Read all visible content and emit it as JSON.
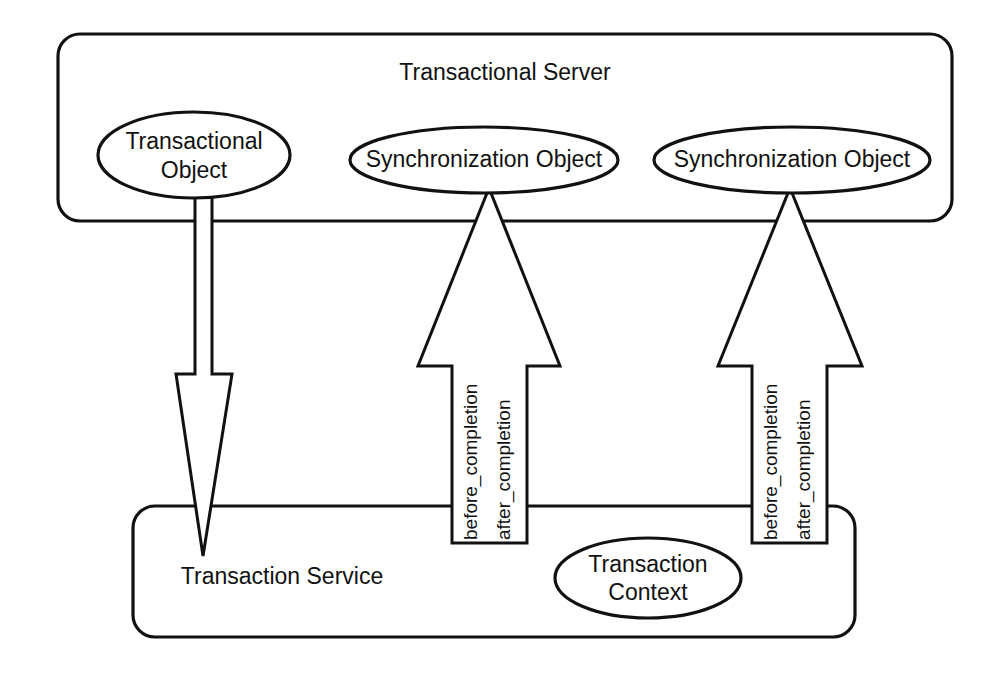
{
  "diagram": {
    "containers": [
      {
        "id": "transactional-server",
        "label": "Transactional Server",
        "label_x": 505,
        "label_y": 74,
        "x": 58,
        "y": 34,
        "width": 894,
        "height": 187,
        "corner_radius": 22
      },
      {
        "id": "transaction-service",
        "label": "Transaction Service",
        "label_x": 282,
        "label_y": 578,
        "x": 133,
        "y": 506,
        "width": 722,
        "height": 131,
        "corner_radius": 22
      }
    ],
    "ellipses": [
      {
        "id": "transactional-object",
        "line1": "Transactional",
        "line2": "Object",
        "cx": 194,
        "cy": 155,
        "rx": 96,
        "ry": 43
      },
      {
        "id": "synchronization-object-left",
        "line1": "Synchronization Object",
        "line2": "",
        "cx": 484,
        "cy": 160,
        "rx": 134,
        "ry": 33
      },
      {
        "id": "synchronization-object-right",
        "line1": "Synchronization Object",
        "line2": "",
        "cx": 792,
        "cy": 160,
        "rx": 138,
        "ry": 33
      },
      {
        "id": "transaction-context",
        "line1": "Transaction",
        "line2": "Context",
        "cx": 648,
        "cy": 578,
        "rx": 93,
        "ry": 40
      }
    ],
    "arrows": [
      {
        "id": "transactional-object-to-transaction-service",
        "direction": "down",
        "label_line1": "",
        "label_line2": "",
        "points": "195,196 212,196 212,374 232,374 203,556 176,374 195,374"
      },
      {
        "id": "synchronization-left-to-server",
        "direction": "up",
        "label_line1": "before_completion",
        "label_line2": "after_completion",
        "label_x1": 472,
        "label_x2": 505,
        "label_y": 540,
        "points": "489,188 560,366 527,366 527,543 452,543 452,366 418,366"
      },
      {
        "id": "synchronization-right-to-server",
        "direction": "up",
        "label_line1": "before_completion",
        "label_line2": "after_completion",
        "label_x1": 772,
        "label_x2": 805,
        "label_y": 540,
        "points": "790,188 862,366 827,366 827,543 752,543 752,366 718,366"
      }
    ],
    "colors": {
      "stroke": "#111111",
      "background": "#ffffff",
      "text": "#111111"
    }
  }
}
